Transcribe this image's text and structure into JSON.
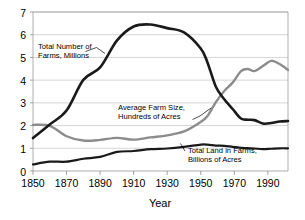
{
  "chart_data": {
    "type": "line",
    "title": "",
    "xlabel": "Year",
    "ylabel": "",
    "xlim": [
      1850,
      2002
    ],
    "ylim": [
      0,
      7
    ],
    "grid": true,
    "legend_position": "inline-annotations",
    "x_ticks": [
      "1850",
      "1870",
      "1890",
      "1910",
      "1930",
      "1950",
      "1970",
      "1990"
    ],
    "x_tick_values": [
      1850,
      1870,
      1890,
      1910,
      1930,
      1950,
      1970,
      1990
    ],
    "y_ticks": [
      "0",
      "1",
      "2",
      "3",
      "4",
      "5",
      "6",
      "7"
    ],
    "y_tick_values": [
      0,
      1,
      2,
      3,
      4,
      5,
      6,
      7
    ],
    "x": [
      1850,
      1860,
      1870,
      1880,
      1890,
      1900,
      1910,
      1920,
      1930,
      1940,
      1950,
      1954,
      1959,
      1964,
      1969,
      1974,
      1978,
      1982,
      1987,
      1992,
      1997,
      2002
    ],
    "series": [
      {
        "name": "Total Number of Farms, Millions",
        "color": "#1a1a1a",
        "width": 2.6,
        "values": [
          1.45,
          2.05,
          2.66,
          4.01,
          4.56,
          5.74,
          6.36,
          6.45,
          6.29,
          6.1,
          5.39,
          4.78,
          3.71,
          3.16,
          2.73,
          2.31,
          2.26,
          2.24,
          2.09,
          2.11,
          2.18,
          2.2
        ]
      },
      {
        "name": "Average Farm Size, Hundreds of Acres",
        "color": "#8c8c8c",
        "width": 2.4,
        "values": [
          2.03,
          1.99,
          1.53,
          1.34,
          1.37,
          1.46,
          1.38,
          1.48,
          1.57,
          1.74,
          2.16,
          2.42,
          3.03,
          3.52,
          3.89,
          4.4,
          4.49,
          4.4,
          4.62,
          4.85,
          4.71,
          4.45
        ]
      },
      {
        "name": "Total Land in Farms, Billions of Acres",
        "color": "#1a1a1a",
        "width": 2.2,
        "values": [
          0.29,
          0.41,
          0.41,
          0.54,
          0.62,
          0.84,
          0.88,
          0.96,
          0.99,
          1.06,
          1.16,
          1.16,
          1.12,
          1.11,
          1.06,
          1.02,
          1.01,
          0.99,
          0.96,
          0.98,
          1.0,
          1.0
        ]
      }
    ],
    "annotations": [
      {
        "id": "farms-count",
        "lines": [
          "Total Number of",
          "Farms, Millions"
        ],
        "text": "Total Number of Farms, Millions"
      },
      {
        "id": "farm-size",
        "lines": [
          "Average Farm Size,",
          "Hundreds of Acres"
        ],
        "text": "Average Farm Size, Hundreds of Acres"
      },
      {
        "id": "land-in-farms",
        "lines": [
          "Total Land in Farms,",
          "Billions of Acres"
        ],
        "text": "Total Land in Farms, Billions of Acres"
      }
    ]
  }
}
